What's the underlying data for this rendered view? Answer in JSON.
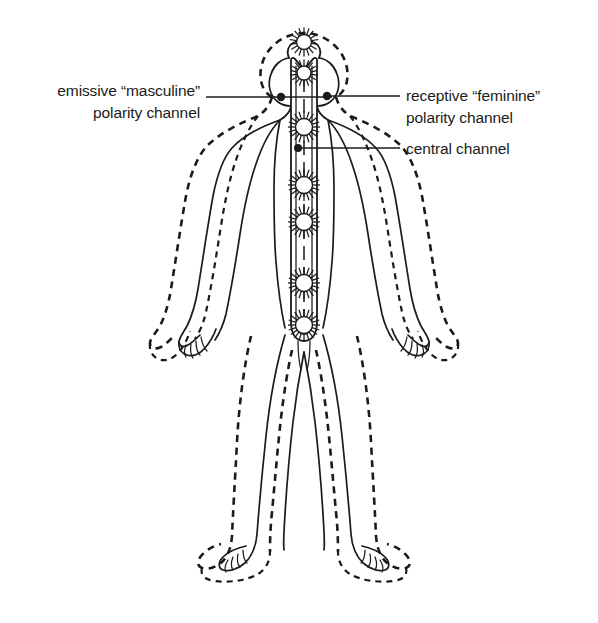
{
  "diagram": {
    "background_color": "#ffffff",
    "ink_color": "#1b1b1b",
    "labels": {
      "left": {
        "line1": "emissive “masculine”",
        "line2": "polarity channel",
        "anchor_x": 332,
        "anchor_y": 98,
        "text_x": 206,
        "text_y1": 100,
        "text_y2": 122
      },
      "right_upper": {
        "line1": "receptive “feminine”",
        "line2": "polarity channel",
        "anchor_x": 337,
        "anchor_y": 96,
        "text_x": 405,
        "text_y1": 98,
        "text_y2": 120
      },
      "right_lower": {
        "line1": "central channel",
        "anchor_x": 298,
        "anchor_y": 148,
        "text_x": 405,
        "text_y1": 152
      }
    },
    "figure": {
      "center_x": 304,
      "head_top_y": 38,
      "feet_bottom_y": 582,
      "description": "front-facing human figure outline with offset dashed aura contour"
    },
    "central_channel": {
      "top_y": 58,
      "bottom_y": 340,
      "left_wall_x": 291,
      "right_wall_x": 317,
      "core_x": 304
    },
    "chakras": [
      {
        "name": "crown-above-head",
        "cx": 304,
        "cy": 42,
        "r": 7.5,
        "rays": 18,
        "ray_len": 7
      },
      {
        "name": "crown-channel-top",
        "cx": 304,
        "cy": 73,
        "r": 7.0,
        "rays": 18,
        "ray_len": 6.5
      },
      {
        "name": "throat",
        "cx": 304,
        "cy": 127,
        "r": 8.5,
        "rays": 20,
        "ray_len": 7.5
      },
      {
        "name": "heart",
        "cx": 304,
        "cy": 185,
        "r": 8.5,
        "rays": 20,
        "ray_len": 7.5
      },
      {
        "name": "solar-plexus",
        "cx": 304,
        "cy": 222,
        "r": 8.5,
        "rays": 20,
        "ray_len": 7.5
      },
      {
        "name": "sacral",
        "cx": 304,
        "cy": 283,
        "r": 8.5,
        "rays": 20,
        "ray_len": 7.5
      },
      {
        "name": "root",
        "cx": 304,
        "cy": 325,
        "r": 8.5,
        "rays": 20,
        "ray_len": 7.5
      }
    ],
    "polarity_dots": [
      {
        "name": "left-polarity-terminus",
        "cx": 281,
        "cy": 97,
        "r": 4.2
      },
      {
        "name": "right-polarity-terminus",
        "cx": 327,
        "cy": 96,
        "r": 4.2
      },
      {
        "name": "central-channel-terminus",
        "cx": 298,
        "cy": 148,
        "r": 4.0
      }
    ]
  }
}
